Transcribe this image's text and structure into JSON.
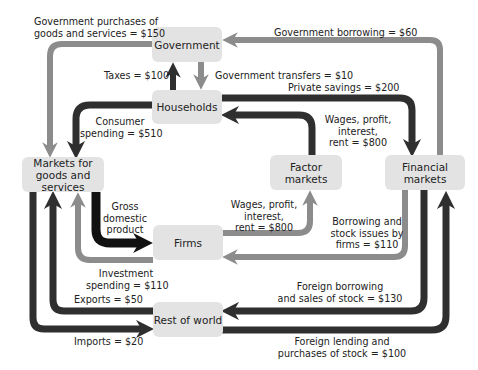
{
  "colors": {
    "black": "#111111",
    "dark": "#2f2f2f",
    "gray": "#8c8c8c",
    "box": "#e3e3e3"
  },
  "nodes": {
    "government": "Government",
    "households": "Households",
    "markets_goods": "Markets for goods and services",
    "factor_markets": "Factor markets",
    "financial_markets": "Financial markets",
    "firms": "Firms",
    "rest_of_world": "Rest of world"
  },
  "flows": {
    "gov_purchases_l1": "Government purchases of",
    "gov_purchases_l2": "goods and services = $150",
    "gov_borrowing": "Government borrowing = $60",
    "taxes": "Taxes = $100",
    "gov_transfers": "Government transfers = $10",
    "private_savings": "Private savings = $200",
    "consumer_spending_l1": "Consumer",
    "consumer_spending_l2": "spending = $510",
    "wages_hh_l1": "Wages, profit,",
    "wages_hh_l2": "interest,",
    "wages_hh_l3": "rent = $800",
    "gdp_l1": "Gross",
    "gdp_l2": "domestic",
    "gdp_l3": "product",
    "wages_firms_l1": "Wages, profit,",
    "wages_firms_l2": "interest,",
    "wages_firms_l3": "rent = $800",
    "borrowing_firms_l1": "Borrowing and",
    "borrowing_firms_l2": "stock issues by",
    "borrowing_firms_l3": "firms = $110",
    "investment_l1": "Investment",
    "investment_l2": "spending = $110",
    "exports": "Exports = $50",
    "imports": "Imports = $20",
    "foreign_borrowing_l1": "Foreign borrowing",
    "foreign_borrowing_l2": "and sales of stock = $130",
    "foreign_lending_l1": "Foreign lending and",
    "foreign_lending_l2": "purchases of stock = $100"
  }
}
